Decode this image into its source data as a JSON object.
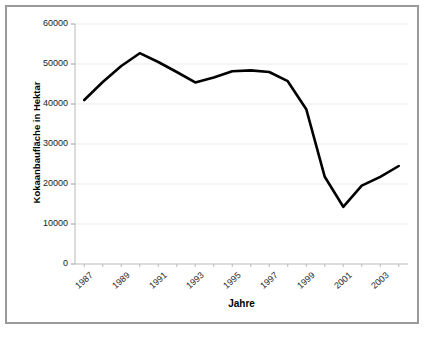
{
  "figure": {
    "border_color": "#9a9a9a",
    "background": "#ffffff"
  },
  "chart_data": {
    "type": "line",
    "title": "",
    "subtitle": "",
    "xlabel": "Jahre",
    "ylabel": "Kokaanbaufläche in Hektar",
    "xlim": [
      1986.5,
      2004.5
    ],
    "ylim": [
      0,
      60000
    ],
    "grid": true,
    "grid_axis": "y",
    "legend": false,
    "legend_position": "none",
    "line_color": "#000000",
    "line_width": 2.6,
    "markers": false,
    "y_ticks": [
      0,
      10000,
      20000,
      30000,
      40000,
      50000,
      60000
    ],
    "y_tick_labels": [
      "0",
      "10000",
      "20000",
      "30000",
      "40000",
      "50000",
      "60000"
    ],
    "x_ticks": [
      1987,
      1989,
      1991,
      1993,
      1995,
      1997,
      1999,
      2001,
      2003
    ],
    "x_tick_labels": [
      "1987",
      "1989",
      "1991",
      "1993",
      "1995",
      "1997",
      "1999",
      "2001",
      "2003"
    ],
    "x_tick_rotation": -42,
    "x": [
      1987,
      1988,
      1989,
      1990,
      1991,
      1992,
      1993,
      1994,
      1995,
      1996,
      1997,
      1998,
      1999,
      2000,
      2001,
      2002,
      2003,
      2004
    ],
    "values": [
      41000,
      45500,
      49500,
      52700,
      50500,
      48000,
      45400,
      46600,
      48200,
      48400,
      48000,
      45700,
      38700,
      21800,
      14300,
      19600,
      21800,
      24500
    ],
    "series": [
      {
        "name": "Kokaanbaufläche",
        "values": [
          41000,
          45500,
          49500,
          52700,
          50500,
          48000,
          45400,
          46600,
          48200,
          48400,
          48000,
          45700,
          38700,
          21800,
          14300,
          19600,
          21800,
          24500
        ]
      }
    ],
    "annotations": []
  },
  "plot_geometry": {
    "left": 75,
    "right": 408,
    "top": 24,
    "bottom": 264
  }
}
